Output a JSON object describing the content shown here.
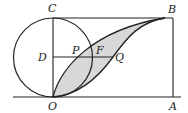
{
  "figure": {
    "type": "geometry-diagram",
    "colors": {
      "stroke": "#222222",
      "shade": "#d8d8d8",
      "background": "#ffffff"
    },
    "labels": {
      "C": "C",
      "B": "B",
      "D": "D",
      "P": "P",
      "F": "F",
      "Q": "Q",
      "O": "O",
      "A": "A"
    },
    "elements": [
      "rectangle OABC",
      "circle centered at D tangent to OA at O and to CB at C",
      "segment CO",
      "segment DQ",
      "curve O-P-B (upper arc)",
      "curve O-Q-B (lower curve)",
      "shaded region between the two curves",
      "baseline through O and A"
    ]
  }
}
